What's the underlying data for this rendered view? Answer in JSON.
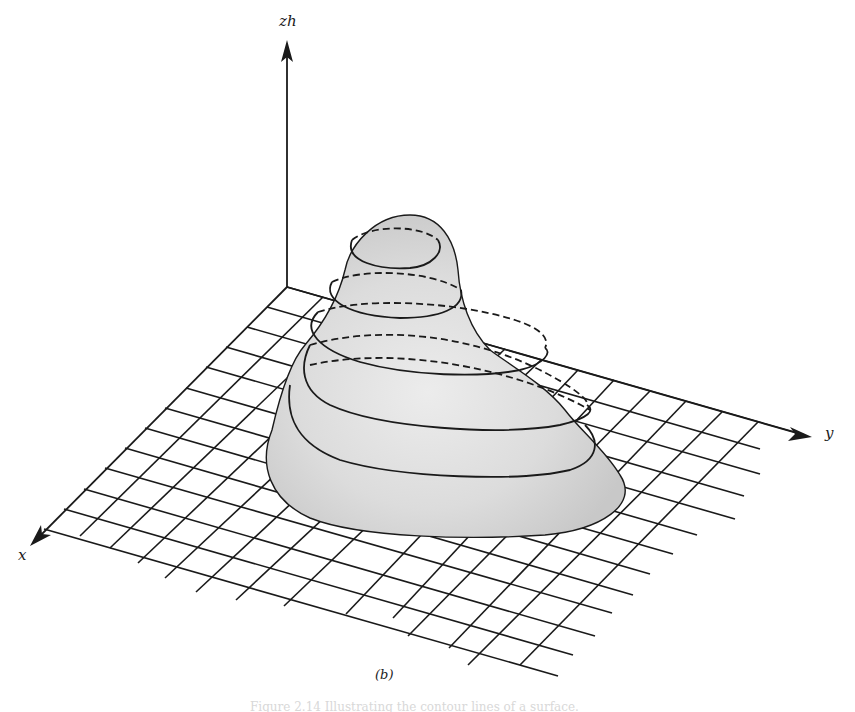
{
  "figure": {
    "subfigure_label": "(b)",
    "caption": "Figure 2.14 Illustrating the contour lines of a surface.",
    "axes": {
      "z_label": "zh",
      "y_label": "y",
      "x_label": "x"
    },
    "surface": {
      "description": "Shaded hill-shaped surface over a grid plane with horizontal contour lines (solid = visible, dashed = hidden)",
      "contour_count": 6,
      "fill_color": "#d9d9d9",
      "line_color": "#1a1a1a"
    },
    "grid": {
      "x_divisions": 13,
      "y_divisions": 14
    }
  }
}
